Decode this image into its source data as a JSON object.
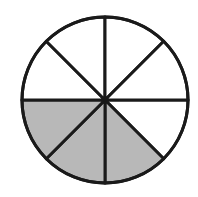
{
  "diagram": {
    "type": "fraction-circle",
    "total_slices": 8,
    "shaded_slices": 3,
    "fraction": "3/8",
    "shaded_slice_indices": [
      1,
      2,
      3
    ],
    "colors": {
      "background": "#ffffff",
      "outline": "#1a1a1a",
      "shaded_fill": "#b8b8b8",
      "unshaded_fill": "#ffffff"
    }
  }
}
